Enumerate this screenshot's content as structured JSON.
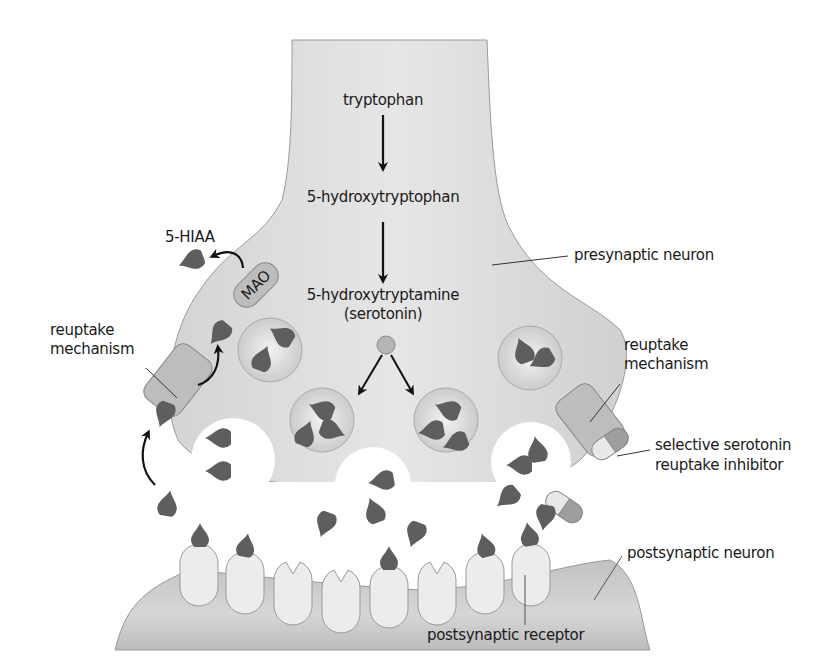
{
  "diagram": {
    "pathway": {
      "step1": "tryptophan",
      "step2": "5-hydroxytryptophan",
      "step3_line1": "5-hydroxytryptamine",
      "step3_line2": "(serotonin)"
    },
    "labels": {
      "presynaptic": "presynaptic neuron",
      "metabolite": "5-HIAA",
      "enzyme": "MAO",
      "reuptake_left_line1": "reuptake",
      "reuptake_left_line2": "mechanism",
      "reuptake_right_line1": "reuptake",
      "reuptake_right_line2": "mechanism",
      "ssri_line1": "selective serotonin",
      "ssri_line2": "reuptake inhibitor",
      "postsynaptic": "postsynaptic neuron",
      "receptor": "postsynaptic receptor"
    },
    "colors": {
      "neuron_fill": "#d9d9d9",
      "neuron_stroke": "#9a9a9a",
      "vesicle_fill": "#cfcfcf",
      "serotonin": "#5e5e5e",
      "receptor_fill": "#ececec",
      "transporter_fill": "#bdbdbd",
      "pill_light": "#e8e8e8",
      "pill_dark": "#9e9e9e",
      "arrow": "#111111",
      "text": "#1a1a1a"
    },
    "counts": {
      "vesicles": 5,
      "receptors": 8,
      "bound_receptors": 5
    }
  }
}
